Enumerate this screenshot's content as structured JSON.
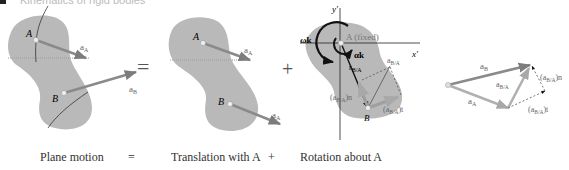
{
  "header": {
    "title": "Kinematics of rigid bodies"
  },
  "panels": {
    "plane_motion": {
      "point_a": "A",
      "point_b": "B",
      "accel_a": "a",
      "accel_a_sub": "A",
      "accel_b": "a",
      "accel_b_sub": "B"
    },
    "equals_sign": "=",
    "translation": {
      "point_a": "A",
      "point_b": "B",
      "accel_a": "a",
      "accel_a_sub": "A",
      "accel_b": "a",
      "accel_b_sub": "A"
    },
    "plus_sign": "+",
    "rotation": {
      "axis_y": "y′",
      "axis_x": "x′",
      "point_a_label": "A (fixed)",
      "omega_label": "ωk",
      "alpha_label": "αk",
      "r_label": "r",
      "r_sub": "B/A",
      "a_ba": "a",
      "a_ba_sub": "B/A",
      "a_ba_n": "(a",
      "a_ba_n_sub": "B/A",
      "a_ba_n_end": ")n",
      "a_ba_t": "(a",
      "a_ba_t_sub": "B/A",
      "a_ba_t_end": ")t",
      "point_b": "B"
    },
    "vector_triangle": {
      "a_b": "a",
      "a_b_sub": "B",
      "a_a": "a",
      "a_a_sub": "A",
      "a_ba": "a",
      "a_ba_sub": "B/A",
      "a_ba_n": "(a",
      "a_ba_n_sub": "B/A",
      "a_ba_n_end": ")n",
      "a_ba_t": "(a",
      "a_ba_t_sub": "B/A",
      "a_ba_t_end": ")t"
    }
  },
  "captions": {
    "plane_motion": "Plane motion",
    "equals": "=",
    "translation": "Translation with A",
    "plus": "+",
    "rotation": "Rotation about A"
  },
  "colors": {
    "body_fill": "#b8b8b8",
    "vector_dark": "#8a8a8a",
    "vector_light": "#a9a9a9",
    "black": "#111111"
  }
}
